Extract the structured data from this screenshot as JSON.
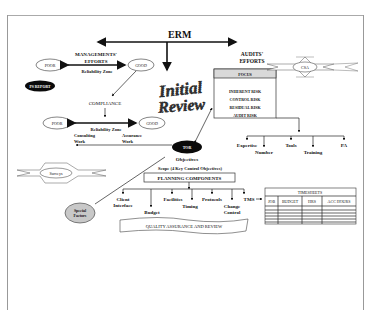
{
  "title": "ERM",
  "management": {
    "heading_line1": "MANAGEMENTS'",
    "heading_line2": "EFFORTS",
    "zone1": "Reliability Zone",
    "poor1": "POOR",
    "good1": "GOOD",
    "ps_report": "PS REPORT",
    "compliance": "COMPLIANCE",
    "poor2": "POOR",
    "good2": "GOOD",
    "zone2": "Reliability Zone",
    "consulting_line1": "Consulting",
    "consulting_line2": "Work",
    "assurance_line1": "Assurance",
    "assurance_line2": "Work"
  },
  "stamp": {
    "line1": "Initial",
    "line2": "Review"
  },
  "audits": {
    "heading_line1": "AUDITS'",
    "heading_line2": "EFFORTS",
    "focus_header": "FOCUS",
    "focus_items": [
      "INHERENT RISK",
      "CONTROL RISK",
      "RESIDUAL RISK",
      "AUDIT RISK"
    ],
    "csa": "CSA",
    "resources": [
      "Expertise",
      "Number",
      "Tools",
      "Training",
      "PA"
    ]
  },
  "tor": {
    "label": "TOR",
    "objectives": "Objectives",
    "scope": "Scope (4 Key Control Objectives)"
  },
  "surveys": "Surveys",
  "special_factors_line1": "Special",
  "special_factors_line2": "Factors",
  "planning": {
    "header": "PLANNING COMPONENTS",
    "components": [
      "Client",
      "Interface",
      "Budget",
      "Facilities",
      "Timing",
      "Protocols",
      "Change",
      "Control",
      "TMS"
    ]
  },
  "quality": "QUALITY ASSURANCE AND REVIEW",
  "timesheets": {
    "title": "TIMESHEETS",
    "columns": [
      "JOB",
      "BUDGET",
      "HRS",
      "ACC HOURS"
    ],
    "rows": 5
  },
  "colors": {
    "stroke": "#222222",
    "focus_header_bg": "#d9d9d9",
    "special_factors_fill": "#c8c8c8",
    "dark_ellipse": "#0a0a0a",
    "frame": "#9a9a9a"
  }
}
